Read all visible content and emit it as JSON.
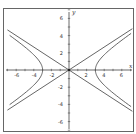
{
  "chart_data": {
    "type": "line",
    "title": "",
    "xlabel": "x",
    "ylabel": "y",
    "xlim": [
      -7.3,
      7.5
    ],
    "ylim": [
      -7.3,
      7.2
    ],
    "grid": false,
    "legend": null,
    "x_ticks": [
      -6,
      -4,
      -2,
      2,
      4,
      6
    ],
    "y_ticks": [
      6,
      4,
      2,
      -2,
      -4,
      -6
    ],
    "x_tick_labels": [
      "-6",
      "-4",
      "-2",
      "2",
      "4",
      "6"
    ],
    "y_tick_labels": [
      "6",
      "4",
      "2",
      "-2",
      "-4",
      "-6"
    ],
    "series": [
      {
        "name": "hyperbola",
        "equation": "x^2/9 - y^2/4 = 1",
        "a": 3,
        "b": 2,
        "vertices": [
          [
            -3,
            0
          ],
          [
            3,
            0
          ]
        ]
      },
      {
        "name": "asymptote-positive",
        "equation": "y = (2/3)x",
        "slope": 0.6667
      },
      {
        "name": "asymptote-negative",
        "equation": "y = -(2/3)x",
        "slope": -0.6667
      }
    ],
    "colors": {
      "curve": "#555555",
      "axis": "#444444",
      "frame": "#666666",
      "background": "#ffffff"
    }
  }
}
